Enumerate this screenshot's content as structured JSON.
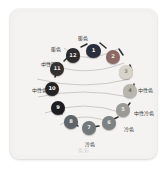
{
  "diagram": {
    "watermark": "色彩",
    "panel_bg": "#f4f3f1",
    "arc_color": "#b9b7b3",
    "connector_color": "#2e2e2e",
    "labels": [
      {
        "id": "warm-top",
        "text": "暖色",
        "x": 73,
        "y": 27,
        "align": "center"
      },
      {
        "id": "warm-upper-left",
        "text": "暖色",
        "x": 46,
        "y": 38,
        "align": "center"
      },
      {
        "id": "neutral-warm",
        "text": "中性暖色",
        "x": 31,
        "y": 53,
        "align": "left"
      },
      {
        "id": "neutral-left",
        "text": "中性色",
        "x": 22,
        "y": 79,
        "align": "left"
      },
      {
        "id": "neutral-right",
        "text": "中性色",
        "x": 128,
        "y": 79,
        "align": "left"
      },
      {
        "id": "neutral-cool",
        "text": "中性冷色",
        "x": 124,
        "y": 102,
        "align": "left"
      },
      {
        "id": "cool-lower-right",
        "text": "冷色",
        "x": 114,
        "y": 118,
        "align": "left"
      },
      {
        "id": "cool-bottom",
        "text": "冷色",
        "x": 80,
        "y": 133,
        "align": "center"
      }
    ],
    "nodes": [
      {
        "n": "1",
        "x": 83.5,
        "y": 42,
        "r": 7.2,
        "color": "#2b2f3d",
        "text_color": "#ffffff"
      },
      {
        "n": "2",
        "x": 103,
        "y": 47.5,
        "r": 7.0,
        "color": "#8a6a63",
        "text_color": "#f2e9e6"
      },
      {
        "n": "3",
        "x": 116,
        "y": 63,
        "r": 6.6,
        "color": "#d8d3c9",
        "text_color": "#8d8a83"
      },
      {
        "n": "4",
        "x": 120,
        "y": 82,
        "r": 6.8,
        "color": "#b8b5ad",
        "text_color": "#6e6c66"
      },
      {
        "n": "5",
        "x": 113,
        "y": 101,
        "r": 6.9,
        "color": "#9b9a96",
        "text_color": "#e8e8e6"
      },
      {
        "n": "6",
        "x": 99,
        "y": 114,
        "r": 6.8,
        "color": "#7f8283",
        "text_color": "#eceded"
      },
      {
        "n": "7",
        "x": 79,
        "y": 119,
        "r": 6.9,
        "color": "#73797b",
        "text_color": "#edefef"
      },
      {
        "n": "8",
        "x": 61,
        "y": 113,
        "r": 6.8,
        "color": "#5e6467",
        "text_color": "#e9ebec"
      },
      {
        "n": "9",
        "x": 48,
        "y": 99,
        "r": 7.0,
        "color": "#1c1c22",
        "text_color": "#ffffff"
      },
      {
        "n": "10",
        "x": 42,
        "y": 80,
        "r": 7.2,
        "color": "#232325",
        "text_color": "#ffffff"
      },
      {
        "n": "11",
        "x": 47,
        "y": 60,
        "r": 7.0,
        "color": "#33302f",
        "text_color": "#f0eeed"
      },
      {
        "n": "12",
        "x": 63,
        "y": 46.5,
        "r": 7.1,
        "color": "#2d2b2c",
        "text_color": "#f2f0ef"
      }
    ]
  }
}
